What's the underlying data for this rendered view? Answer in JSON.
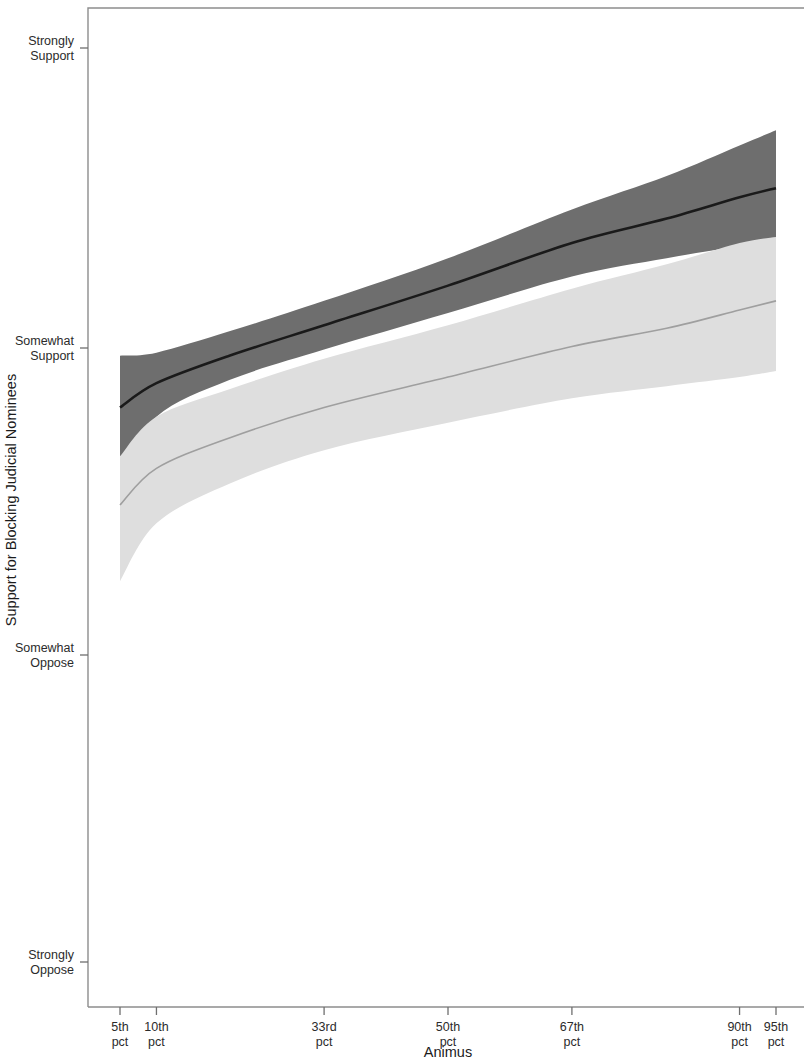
{
  "figure": {
    "background": "#ffffff",
    "frame_color": "#8d8d8d"
  },
  "chart_data": {
    "type": "line",
    "title": "",
    "subtitle": "",
    "xlabel": "Animus",
    "ylabel": "Support for Blocking Judicial Nominees",
    "grid": false,
    "legend": null,
    "x": [
      5,
      10,
      33,
      50,
      67,
      90,
      95
    ],
    "x_tick_labels": [
      "5th\npct",
      "10th\npct",
      "33rd\npct",
      "50th\npct",
      "67th\npct",
      "90th\npct",
      "95th\npct"
    ],
    "x_ticks": [
      {
        "label_line1": "5th",
        "label_line2": "pct",
        "value": 5
      },
      {
        "label_line1": "10th",
        "label_line2": "pct",
        "value": 10
      },
      {
        "label_line1": "33rd",
        "label_line2": "pct",
        "value": 33
      },
      {
        "label_line1": "50th",
        "label_line2": "pct",
        "value": 50
      },
      {
        "label_line1": "67th",
        "label_line2": "pct",
        "value": 67
      },
      {
        "label_line1": "90th",
        "label_line2": "pct",
        "value": 90
      },
      {
        "label_line1": "95th",
        "label_line2": "pct",
        "value": 95
      }
    ],
    "y_ticks": [
      {
        "label_line1": "Strongly",
        "label_line2": "Support",
        "value": 4
      },
      {
        "label_line1": "Somewhat",
        "label_line2": "Support",
        "value": 3
      },
      {
        "label_line1": "Somewhat",
        "label_line2": "Oppose",
        "value": 2
      },
      {
        "label_line1": "Strongly",
        "label_line2": "Oppose",
        "value": 1
      }
    ],
    "ylim": [
      1,
      4
    ],
    "xlim": [
      5,
      95
    ],
    "series": [
      {
        "name": "dark-series",
        "color": "#1a1a1a",
        "band_color": "#6e6e6e",
        "band_opacity": 1,
        "x": [
          5,
          10,
          20,
          33,
          50,
          67,
          80,
          90,
          95
        ],
        "values": [
          2.82,
          2.9,
          2.99,
          3.09,
          3.22,
          3.36,
          3.44,
          3.51,
          3.54
        ],
        "ci_upper": [
          2.99,
          3.0,
          3.07,
          3.17,
          3.31,
          3.47,
          3.58,
          3.68,
          3.73
        ],
        "ci_lower": [
          2.6,
          2.79,
          2.91,
          3.01,
          3.13,
          3.25,
          3.31,
          3.35,
          3.37
        ]
      },
      {
        "name": "light-series",
        "color": "#9f9f9f",
        "band_color": "#dedede",
        "band_opacity": 1,
        "x": [
          5,
          10,
          20,
          33,
          50,
          67,
          80,
          90,
          95
        ],
        "values": [
          2.5,
          2.62,
          2.72,
          2.82,
          2.92,
          3.02,
          3.08,
          3.14,
          3.17
        ],
        "ci_upper": [
          2.66,
          2.79,
          2.88,
          2.98,
          3.09,
          3.21,
          3.29,
          3.36,
          3.38
        ],
        "ci_lower": [
          2.25,
          2.44,
          2.57,
          2.68,
          2.77,
          2.85,
          2.89,
          2.92,
          2.94
        ]
      }
    ]
  }
}
